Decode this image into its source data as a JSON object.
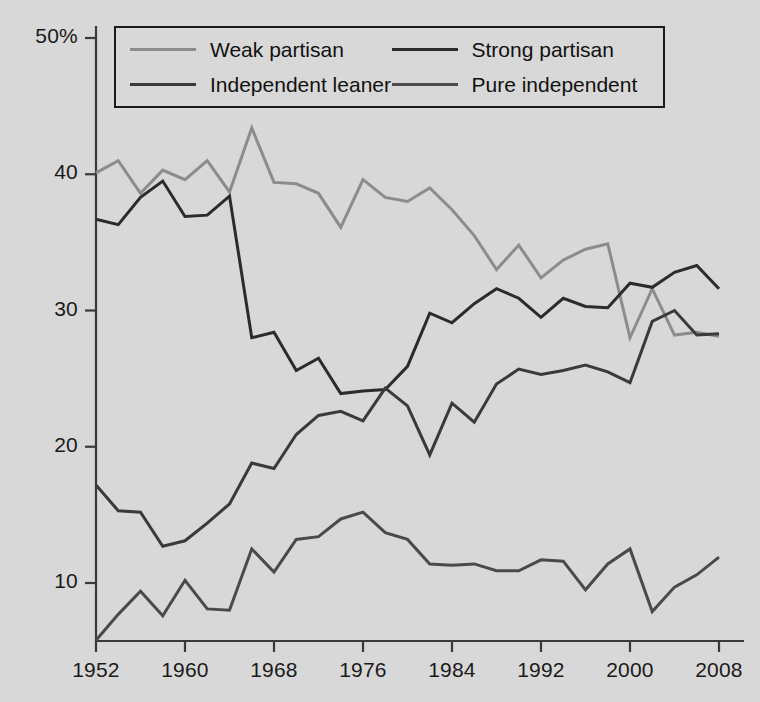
{
  "chart_data": {
    "type": "line",
    "title": "",
    "subtitle": "",
    "xlabel": "",
    "ylabel": "",
    "xlim": [
      1952,
      2008
    ],
    "ylim": [
      5.2,
      50
    ],
    "grid": false,
    "legend_position": "top-center",
    "x_tick_labels": [
      "1952",
      "1960",
      "1968",
      "1976",
      "1984",
      "1992",
      "2000",
      "2008"
    ],
    "x_ticks": [
      1952,
      1960,
      1968,
      1976,
      1984,
      1992,
      2000,
      2008
    ],
    "y_tick_labels": [
      "50%",
      "40",
      "30",
      "20",
      "10"
    ],
    "y_ticks": [
      50,
      40,
      30,
      20,
      10
    ],
    "x": [
      1952,
      1954,
      1956,
      1958,
      1960,
      1962,
      1964,
      1966,
      1968,
      1970,
      1972,
      1974,
      1976,
      1978,
      1980,
      1982,
      1984,
      1986,
      1988,
      1990,
      1992,
      1994,
      1996,
      1998,
      2000,
      2002,
      2004,
      2006,
      2008
    ],
    "series": [
      {
        "name": "Weak partisan",
        "color": "#8c8c8c",
        "width": 3,
        "values": [
          40.1,
          41.0,
          38.6,
          40.3,
          39.6,
          41.0,
          38.7,
          43.4,
          39.4,
          39.3,
          38.6,
          36.1,
          39.6,
          38.3,
          38.0,
          39.0,
          37.4,
          35.5,
          33.0,
          34.8,
          32.4,
          33.7,
          34.5,
          34.9,
          28.0,
          31.6,
          28.2,
          28.4,
          28.1
        ]
      },
      {
        "name": "Strong partisan",
        "color": "#2b2b2b",
        "width": 3,
        "values": [
          36.7,
          36.3,
          38.3,
          39.5,
          36.9,
          37.0,
          38.4,
          28.0,
          28.4,
          25.6,
          26.5,
          23.9,
          24.1,
          24.2,
          25.9,
          29.8,
          29.1,
          30.5,
          31.6,
          30.9,
          29.5,
          30.9,
          30.3,
          30.2,
          32.0,
          31.7,
          32.8,
          33.3,
          31.6
        ]
      },
      {
        "name": "Independent leaner",
        "color": "#3a3a3a",
        "width": 3,
        "values": [
          17.2,
          15.3,
          15.2,
          12.7,
          13.1,
          14.4,
          15.8,
          18.8,
          18.4,
          20.9,
          22.3,
          22.6,
          21.9,
          24.3,
          23.0,
          19.4,
          23.2,
          21.8,
          24.6,
          25.7,
          25.3,
          25.6,
          26.0,
          25.5,
          24.7,
          29.2,
          30.0,
          28.2,
          28.3
        ]
      },
      {
        "name": "Pure independent",
        "color": "#4a4a4a",
        "width": 3,
        "values": [
          5.8,
          7.7,
          9.4,
          7.6,
          10.2,
          8.1,
          8.0,
          12.5,
          10.8,
          13.2,
          13.4,
          14.7,
          15.2,
          13.7,
          13.2,
          11.4,
          11.3,
          11.4,
          10.9,
          10.9,
          11.7,
          11.6,
          9.5,
          11.4,
          12.5,
          7.9,
          9.7,
          10.6,
          11.9
        ]
      }
    ]
  },
  "axis": {
    "line_color": "#3a3a3a",
    "tick_color": "#3a3a3a",
    "label_color": "#1a1a1a"
  },
  "background": {
    "color": "#d8d8d8"
  },
  "legend": {
    "border_color": "#1a1a1a",
    "entries": [
      {
        "label": "Weak partisan",
        "color": "#8c8c8c"
      },
      {
        "label": "Strong partisan",
        "color": "#2b2b2b"
      },
      {
        "label": "Independent leaner",
        "color": "#3a3a3a"
      },
      {
        "label": "Pure independent",
        "color": "#4a4a4a"
      }
    ]
  }
}
